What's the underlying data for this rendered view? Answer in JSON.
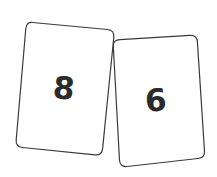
{
  "cards": [
    {
      "value": "8",
      "corners": [
        [
          26,
          22
        ],
        [
          114,
          30
        ],
        [
          102,
          155
        ],
        [
          16,
          147
        ]
      ]
    },
    {
      "value": "6",
      "corners": [
        [
          114,
          39
        ],
        [
          196,
          34
        ],
        [
          205,
          158
        ],
        [
          120,
          167
        ]
      ]
    }
  ],
  "colors": {
    "background": "#ffffff",
    "card_fill": "#ffffff",
    "card_border": "#3a3a3a",
    "number_text": "#2b2b2b"
  }
}
